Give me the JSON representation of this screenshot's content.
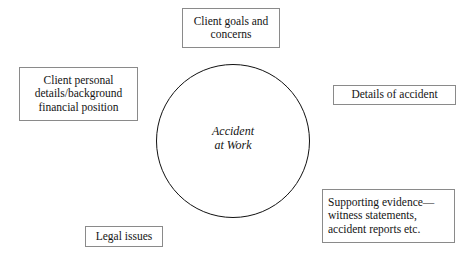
{
  "diagram": {
    "center": {
      "name": "central-circle",
      "lines": [
        "Accident",
        "at Work"
      ],
      "shape": "circle",
      "style": "italic",
      "border_color": "#111111",
      "fill_color": "#ffffff"
    },
    "nodes": [
      {
        "id": "client-goals",
        "lines": [
          "Client goals and",
          "concerns"
        ],
        "align": "center",
        "position": "top"
      },
      {
        "id": "client-personal",
        "lines": [
          "Client personal",
          "details/background",
          "financial position"
        ],
        "align": "center",
        "position": "left"
      },
      {
        "id": "details-accident",
        "lines": [
          "Details of accident"
        ],
        "align": "center",
        "position": "right"
      },
      {
        "id": "supporting-evidence",
        "lines": [
          "Supporting evidence—",
          "witness statements,",
          "accident reports etc."
        ],
        "align": "left",
        "position": "bottom-right"
      },
      {
        "id": "legal-issues",
        "lines": [
          "Legal issues"
        ],
        "align": "center",
        "position": "bottom-left"
      }
    ],
    "colors": {
      "box_border": "#8a8a8a",
      "circle_border": "#111111",
      "background": "#ffffff",
      "text": "#141414"
    }
  }
}
